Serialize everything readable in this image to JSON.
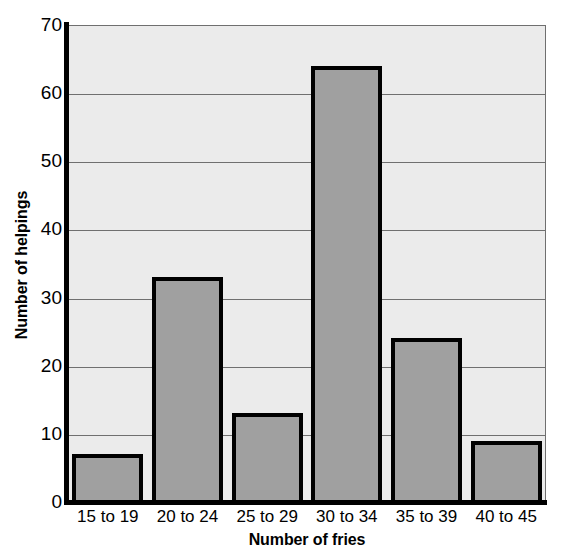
{
  "chart_data": {
    "type": "bar",
    "title": "",
    "xlabel": "Number of fries",
    "ylabel": "Number of helpings",
    "categories": [
      "15 to 19",
      "20 to 24",
      "25 to 29",
      "30 to 34",
      "35 to 39",
      "40 to 45"
    ],
    "values": [
      7,
      33,
      13,
      64,
      24,
      9
    ],
    "ylim": [
      0,
      70
    ],
    "yticks": [
      0,
      10,
      20,
      30,
      40,
      50,
      60,
      70
    ],
    "ytick_labels": [
      "0",
      "10",
      "20",
      "30",
      "40",
      "50",
      "60",
      "70"
    ],
    "grid": true,
    "grid_axis": "y",
    "legend": false,
    "legend_position": "none",
    "colors": {
      "bar_fill": "#a0a0a0",
      "bar_edge": "#000000",
      "plot_background": "#ebebeb",
      "figure_background": "#ffffff",
      "gridline": "#6f6f6f",
      "axis": "#000000",
      "text": "#000000"
    }
  }
}
